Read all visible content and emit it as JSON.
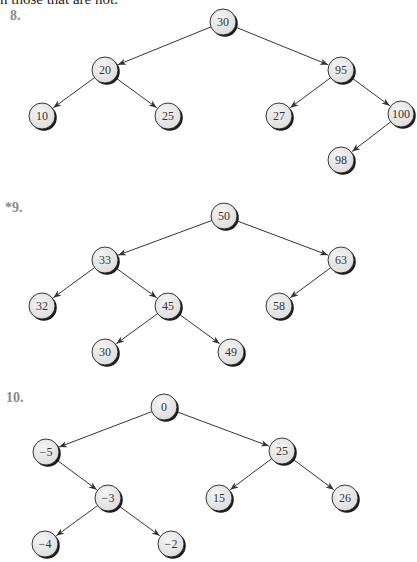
{
  "header": {
    "cut_off_text": "n those that are not."
  },
  "problems": [
    {
      "label": "8.",
      "label_pos": [
        10,
        8
      ],
      "nodes": [
        {
          "id": "a",
          "value": "30",
          "x": 223,
          "y": 22
        },
        {
          "id": "b",
          "value": "20",
          "x": 105,
          "y": 70
        },
        {
          "id": "c",
          "value": "10",
          "x": 42,
          "y": 116
        },
        {
          "id": "d",
          "value": "25",
          "x": 168,
          "y": 116
        },
        {
          "id": "e",
          "value": "95",
          "x": 341,
          "y": 70
        },
        {
          "id": "f",
          "value": "27",
          "x": 279,
          "y": 116
        },
        {
          "id": "g",
          "value": "100",
          "x": 401,
          "y": 114
        },
        {
          "id": "h",
          "value": "98",
          "x": 341,
          "y": 160
        }
      ],
      "edges": [
        [
          "a",
          "b"
        ],
        [
          "a",
          "e"
        ],
        [
          "b",
          "c"
        ],
        [
          "b",
          "d"
        ],
        [
          "e",
          "f"
        ],
        [
          "e",
          "g"
        ],
        [
          "g",
          "h"
        ]
      ]
    },
    {
      "label": "*9.",
      "label_pos": [
        5,
        200
      ],
      "nodes": [
        {
          "id": "a",
          "value": "50",
          "x": 224,
          "y": 216
        },
        {
          "id": "b",
          "value": "33",
          "x": 105,
          "y": 260
        },
        {
          "id": "c",
          "value": "32",
          "x": 42,
          "y": 306
        },
        {
          "id": "d",
          "value": "45",
          "x": 168,
          "y": 306
        },
        {
          "id": "e",
          "value": "30",
          "x": 105,
          "y": 352
        },
        {
          "id": "f",
          "value": "49",
          "x": 231,
          "y": 352
        },
        {
          "id": "g",
          "value": "63",
          "x": 341,
          "y": 260
        },
        {
          "id": "h",
          "value": "58",
          "x": 279,
          "y": 306
        }
      ],
      "edges": [
        [
          "a",
          "b"
        ],
        [
          "a",
          "g"
        ],
        [
          "b",
          "c"
        ],
        [
          "b",
          "d"
        ],
        [
          "d",
          "e"
        ],
        [
          "d",
          "f"
        ],
        [
          "g",
          "h"
        ]
      ]
    },
    {
      "label": "10.",
      "label_pos": [
        6,
        390
      ],
      "nodes": [
        {
          "id": "a",
          "value": "0",
          "x": 164,
          "y": 407
        },
        {
          "id": "b",
          "value": "−5",
          "x": 46,
          "y": 452
        },
        {
          "id": "c",
          "value": "−3",
          "x": 108,
          "y": 498
        },
        {
          "id": "d",
          "value": "−4",
          "x": 45,
          "y": 544
        },
        {
          "id": "e",
          "value": "−2",
          "x": 171,
          "y": 544
        },
        {
          "id": "f",
          "value": "25",
          "x": 282,
          "y": 451
        },
        {
          "id": "g",
          "value": "15",
          "x": 219,
          "y": 498
        },
        {
          "id": "h",
          "value": "26",
          "x": 345,
          "y": 498
        }
      ],
      "edges": [
        [
          "a",
          "b"
        ],
        [
          "a",
          "f"
        ],
        [
          "b",
          "c"
        ],
        [
          "c",
          "d"
        ],
        [
          "c",
          "e"
        ],
        [
          "f",
          "g"
        ],
        [
          "f",
          "h"
        ]
      ]
    }
  ],
  "style": {
    "node_fill": "#e6e6e6",
    "node_stroke": "#222222",
    "shadow": "#1a1a1a",
    "edge_color": "#333333",
    "label_color": "#8a8a8a",
    "node_radius": 13
  }
}
